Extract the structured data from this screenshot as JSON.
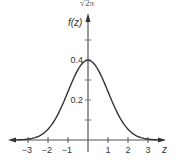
{
  "chart_data": {
    "type": "line",
    "title": "",
    "top_annotation": "√2π",
    "xlabel": "z",
    "ylabel": "f(z)",
    "xlim": [
      -3.9,
      3.9
    ],
    "ylim": [
      0,
      0.6
    ],
    "x_ticks": [
      -3,
      -2,
      -1,
      1,
      2,
      3
    ],
    "x_tick_labels": [
      "−3",
      "−2",
      "−1",
      "1",
      "2",
      "3"
    ],
    "y_ticks": [
      0.1,
      0.2,
      0.3,
      0.4,
      0.5
    ],
    "y_tick_labels": {
      "0.2": "0.2",
      "0.4": "0.4"
    },
    "grid": false,
    "legend": null,
    "series": [
      {
        "name": "standard normal density",
        "x": [
          -3.8,
          -3,
          -2.5,
          -2,
          -1.5,
          -1,
          -0.5,
          0,
          0.5,
          1,
          1.5,
          2,
          2.5,
          3,
          3.8
        ],
        "values": [
          0.0003,
          0.0044,
          0.0175,
          0.054,
          0.1295,
          0.242,
          0.3521,
          0.3989,
          0.3521,
          0.242,
          0.1295,
          0.054,
          0.0175,
          0.0044,
          0.0003
        ]
      }
    ],
    "colors": {
      "curve": "#333333",
      "axis": "#555555",
      "text": "#333333"
    }
  }
}
